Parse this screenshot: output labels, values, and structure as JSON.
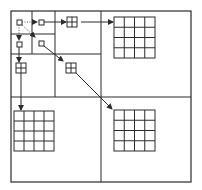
{
  "diagram": {
    "type": "quadtree-hierarchical-upsampling",
    "colors": {
      "stroke": "#2b2b2b",
      "background": "#ffffff"
    },
    "frame": {
      "x": 11,
      "y": 11,
      "w": 180,
      "h": 171
    },
    "dividers": [
      {
        "x1": 101,
        "y1": 11,
        "x2": 101,
        "y2": 182
      },
      {
        "x1": 11,
        "y1": 97,
        "x2": 191,
        "y2": 97
      },
      {
        "x1": 55,
        "y1": 11,
        "x2": 55,
        "y2": 97
      },
      {
        "x1": 11,
        "y1": 54,
        "x2": 101,
        "y2": 54
      },
      {
        "x1": 32,
        "y1": 11,
        "x2": 32,
        "y2": 54
      },
      {
        "x1": 11,
        "y1": 34,
        "x2": 55,
        "y2": 34
      }
    ],
    "grids": [
      {
        "name": "grid-1x1-origin",
        "x": 17,
        "y": 20,
        "size": 5,
        "n": 1
      },
      {
        "name": "grid-1x1-right",
        "x": 39,
        "y": 20,
        "size": 5,
        "n": 1
      },
      {
        "name": "grid-1x1-down",
        "x": 17,
        "y": 42,
        "size": 5,
        "n": 1
      },
      {
        "name": "grid-1x1-diag",
        "x": 39,
        "y": 41,
        "size": 5,
        "n": 1
      },
      {
        "name": "grid-2x2-right",
        "x": 67,
        "y": 17,
        "size": 10,
        "n": 2
      },
      {
        "name": "grid-2x2-down",
        "x": 16,
        "y": 63,
        "size": 10,
        "n": 2
      },
      {
        "name": "grid-2x2-diag",
        "x": 66,
        "y": 63,
        "size": 10,
        "n": 2
      },
      {
        "name": "grid-4x4-right",
        "x": 114,
        "y": 17,
        "size": 41,
        "n": 4
      },
      {
        "name": "grid-4x4-down",
        "x": 14,
        "y": 111,
        "size": 40,
        "n": 4
      },
      {
        "name": "grid-4x4-diag",
        "x": 114,
        "y": 110,
        "size": 41,
        "n": 4
      }
    ],
    "arrows": [
      {
        "name": "arrow-origin-to-right",
        "x1": 22,
        "y1": 22,
        "x2": 37,
        "y2": 22,
        "dotted": true
      },
      {
        "name": "arrow-origin-to-down",
        "x1": 19,
        "y1": 25,
        "x2": 19,
        "y2": 40,
        "dotted": true
      },
      {
        "name": "arrow-origin-to-diag",
        "x1": 22,
        "y1": 25,
        "x2": 35,
        "y2": 37,
        "dotted": true
      },
      {
        "name": "arrow-right-1-to-2",
        "x1": 44,
        "y1": 22,
        "x2": 66,
        "y2": 22,
        "dotted": false
      },
      {
        "name": "arrow-right-2-to-4",
        "x1": 81,
        "y1": 22,
        "x2": 113,
        "y2": 22,
        "dotted": false
      },
      {
        "name": "arrow-down-1-to-2",
        "x1": 19,
        "y1": 47,
        "x2": 19,
        "y2": 62,
        "dotted": false
      },
      {
        "name": "arrow-down-2-to-4",
        "x1": 21,
        "y1": 73,
        "x2": 21,
        "y2": 110,
        "dotted": false
      },
      {
        "name": "arrow-diag-1-to-2",
        "x1": 44,
        "y1": 46,
        "x2": 63,
        "y2": 61,
        "dotted": false
      },
      {
        "name": "arrow-diag-2-to-4",
        "x1": 76,
        "y1": 73,
        "x2": 112,
        "y2": 109,
        "dotted": false
      }
    ],
    "vertical_tick": {
      "x1": 32,
      "y1": 11,
      "x2": 32,
      "y2": 24
    }
  }
}
